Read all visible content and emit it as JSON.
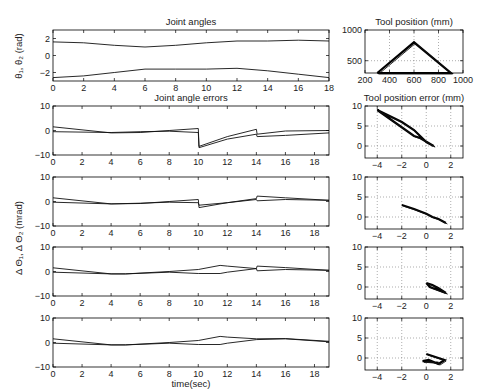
{
  "chart_data": [
    {
      "type": "line",
      "title": "Joint angles",
      "xlabel": "",
      "ylabel": "θ1, θ2 (rad)",
      "xlim": [
        0,
        18
      ],
      "ylim": [
        -3,
        3
      ],
      "xticks": [
        "0",
        "2",
        "4",
        "6",
        "8",
        "10",
        "12",
        "14",
        "16",
        "18"
      ],
      "yticks": [
        "-2",
        "0",
        "2"
      ],
      "grid": false,
      "series": [
        {
          "name": "theta1",
          "x": [
            0,
            2,
            4,
            6,
            8,
            10,
            12,
            14,
            16,
            18
          ],
          "values": [
            1.6,
            1.5,
            1.2,
            1.0,
            1.2,
            1.5,
            1.7,
            1.7,
            1.8,
            1.7
          ]
        },
        {
          "name": "theta2",
          "x": [
            0,
            2,
            4,
            6,
            8,
            10,
            12,
            14,
            16,
            18
          ],
          "values": [
            -2.6,
            -2.4,
            -2.0,
            -1.6,
            -1.6,
            -1.6,
            -1.5,
            -1.8,
            -2.2,
            -2.6
          ]
        }
      ]
    },
    {
      "type": "line",
      "title": "Tool position (mm)",
      "xlim": [
        200,
        1000
      ],
      "ylim": [
        300,
        1000
      ],
      "xticks": [
        "200",
        "400",
        "600",
        "800",
        "1000"
      ],
      "yticks": [
        "500",
        "1000"
      ],
      "grid": true,
      "series": [
        {
          "name": "path",
          "x": [
            300,
            600,
            900,
            300
          ],
          "values": [
            300,
            800,
            300,
            300
          ]
        }
      ]
    },
    {
      "type": "line",
      "title": "Joint angle errors",
      "ylabel": "Δ Θ1, Δ Θ2 (mrad)",
      "xlim": [
        0,
        19
      ],
      "ylim": [
        -10,
        10
      ],
      "xticks": [
        "0",
        "2",
        "4",
        "6",
        "8",
        "10",
        "12",
        "14",
        "16",
        "18"
      ],
      "yticks": [
        "-10",
        "0",
        "10"
      ],
      "series": [
        {
          "name": "e1",
          "x": [
            0,
            4,
            6,
            8,
            10,
            10.05,
            12,
            14,
            14.05,
            16,
            19
          ],
          "values": [
            1.5,
            -1,
            -0.8,
            0,
            0.8,
            -6.5,
            -2.5,
            0.5,
            -1.5,
            -0.2,
            0
          ]
        },
        {
          "name": "e2",
          "x": [
            0,
            4,
            6,
            8,
            10,
            10.05,
            12,
            14,
            14.05,
            16,
            19
          ],
          "values": [
            -0.5,
            -0.8,
            -0.5,
            -0.3,
            -0.8,
            -7,
            -3.5,
            -1.5,
            -2.5,
            -2,
            -1
          ]
        }
      ]
    },
    {
      "type": "line",
      "title": "Tool position error (mm)",
      "xlim": [
        -5,
        3
      ],
      "ylim": [
        -3,
        10
      ],
      "xticks": [
        "-4",
        "-2",
        "0",
        "2"
      ],
      "yticks": [
        "0",
        "5",
        "10"
      ],
      "grid": true,
      "series": [
        {
          "name": "err",
          "x": [
            -4,
            -2,
            -1,
            0,
            0.6,
            -0.5,
            -1,
            -4
          ],
          "values": [
            9,
            6,
            4,
            1,
            0,
            2,
            2.5,
            9
          ]
        }
      ]
    },
    {
      "type": "line",
      "xlim": [
        0,
        19
      ],
      "ylim": [
        -10,
        10
      ],
      "xticks": [
        "0",
        "2",
        "4",
        "6",
        "8",
        "10",
        "12",
        "14",
        "16",
        "18"
      ],
      "yticks": [
        "-10",
        "0",
        "10"
      ],
      "series": [
        {
          "name": "e1",
          "x": [
            0,
            4,
            6,
            8,
            10,
            10.05,
            12,
            14,
            14.05,
            16,
            19
          ],
          "values": [
            1.5,
            -1,
            -0.8,
            0,
            0.8,
            -2.5,
            -0.5,
            1.2,
            2.2,
            1.5,
            0.5
          ]
        },
        {
          "name": "e2",
          "x": [
            0,
            4,
            6,
            8,
            10,
            10.05,
            12,
            14,
            14.05,
            16,
            19
          ],
          "values": [
            -0.3,
            -1,
            -0.7,
            -0.3,
            -0.5,
            -1.5,
            -0.5,
            0.8,
            0.3,
            0.8,
            0.5
          ]
        }
      ]
    },
    {
      "type": "line",
      "xlim": [
        -5,
        3
      ],
      "ylim": [
        -3,
        10
      ],
      "xticks": [
        "-4",
        "-2",
        "0",
        "2"
      ],
      "yticks": [
        "0",
        "5",
        "10"
      ],
      "grid": true,
      "series": [
        {
          "name": "err",
          "x": [
            -2,
            -1,
            0,
            0.5,
            1,
            1.6
          ],
          "values": [
            3,
            2,
            0.8,
            0,
            -0.5,
            -1.5
          ]
        }
      ]
    },
    {
      "type": "line",
      "xlim": [
        0,
        19
      ],
      "ylim": [
        -10,
        10
      ],
      "xticks": [
        "0",
        "2",
        "4",
        "6",
        "8",
        "10",
        "12",
        "14",
        "16",
        "18"
      ],
      "yticks": [
        "-10",
        "0",
        "10"
      ],
      "series": [
        {
          "name": "e1",
          "x": [
            0,
            4,
            5,
            8,
            10,
            11.5,
            12,
            14,
            14.05,
            16,
            19
          ],
          "values": [
            1.5,
            -1,
            -1,
            0,
            0.8,
            2.5,
            2.2,
            1.2,
            2.2,
            1.6,
            0.5
          ]
        },
        {
          "name": "e2",
          "x": [
            0,
            4,
            5,
            8,
            10,
            11.5,
            12,
            14,
            14.05,
            16,
            19
          ],
          "values": [
            -0.3,
            -1,
            -1,
            -0.3,
            -0.8,
            -0.8,
            -0.3,
            1.2,
            0.3,
            0.8,
            0.5
          ]
        }
      ]
    },
    {
      "type": "line",
      "xlim": [
        -5,
        3
      ],
      "ylim": [
        -3,
        10
      ],
      "xticks": [
        "-4",
        "-2",
        "0",
        "2"
      ],
      "yticks": [
        "0",
        "5",
        "10"
      ],
      "grid": true,
      "series": [
        {
          "name": "err",
          "x": [
            0,
            0.5,
            1,
            1.6,
            1,
            0.3,
            0
          ],
          "values": [
            1,
            0.5,
            -0.3,
            -1.5,
            -0.8,
            0,
            1
          ]
        }
      ]
    },
    {
      "type": "line",
      "xlabel": "time(sec)",
      "xlim": [
        0,
        19
      ],
      "ylim": [
        -10,
        10
      ],
      "xticks": [
        "0",
        "2",
        "4",
        "6",
        "8",
        "10",
        "12",
        "14",
        "16",
        "18"
      ],
      "yticks": [
        "-10",
        "0",
        "10"
      ],
      "series": [
        {
          "name": "e1",
          "x": [
            0,
            4,
            5,
            8,
            10,
            11.5,
            12,
            14,
            16,
            19
          ],
          "values": [
            1.5,
            -1,
            -1,
            0,
            0.8,
            2.5,
            2.2,
            1.5,
            1.6,
            0.5
          ]
        },
        {
          "name": "e2",
          "x": [
            0,
            4,
            5,
            8,
            10,
            11.5,
            12,
            14,
            16,
            19
          ],
          "values": [
            -0.3,
            -1,
            -1,
            -0.3,
            -0.8,
            -0.8,
            -0.3,
            1.2,
            1.5,
            0.3
          ]
        }
      ]
    },
    {
      "type": "line",
      "xlim": [
        -5,
        3
      ],
      "ylim": [
        -3,
        10
      ],
      "xticks": [
        "-4",
        "-2",
        "0",
        "2"
      ],
      "yticks": [
        "0",
        "5",
        "10"
      ],
      "grid": true,
      "series": [
        {
          "name": "err",
          "x": [
            0,
            0.5,
            1.5,
            1,
            0.2,
            -0.3,
            0.5,
            1
          ],
          "values": [
            1,
            0.5,
            -0.5,
            -1.5,
            -0.5,
            -0.8,
            -1,
            -1.2
          ]
        }
      ]
    }
  ],
  "labels": {
    "joint_angles_title": "Joint angles",
    "tool_position_title": "Tool position (mm)",
    "joint_errors_title": "Joint angle errors",
    "tool_error_title": "Tool position error (mm)",
    "top_ylabel": "θ₁, θ₂ (rad)",
    "error_ylabel": "Δ Θ₁, Δ Θ₂ (mrad)",
    "xlabel_time": "time(sec)"
  }
}
